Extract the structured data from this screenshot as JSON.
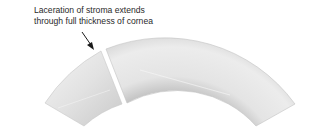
{
  "annotation": {
    "line1": "Laceration of stroma extends",
    "line2": "through full thickness of cornea"
  },
  "figure": {
    "fragments": [
      "left-fragment",
      "right-fragment"
    ],
    "colors": {
      "tissue_light": "#f2f2f2",
      "tissue_mid": "#dcdcdc",
      "tissue_dark": "#bdbdbd",
      "arrow": "#1a1a1a",
      "text": "#2a2a2a"
    }
  }
}
